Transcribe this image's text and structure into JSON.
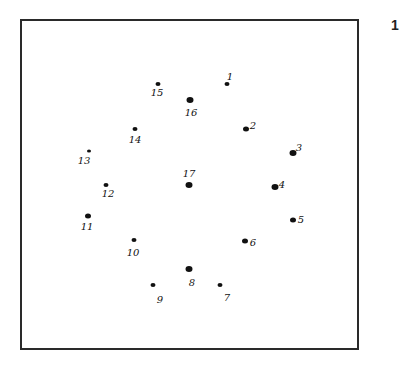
{
  "figure": {
    "number": "1",
    "frame": {
      "left": 20,
      "top": 19,
      "width": 339,
      "height": 331,
      "border_color": "#2a2a2a"
    },
    "ink_color": "#111111",
    "points": [
      {
        "label": "1",
        "x": 227,
        "y": 84,
        "r": 5,
        "lx": 230,
        "ly": 77
      },
      {
        "label": "2",
        "x": 246,
        "y": 129,
        "r": 6,
        "lx": 253,
        "ly": 126
      },
      {
        "label": "3",
        "x": 293,
        "y": 153,
        "r": 7,
        "lx": 299,
        "ly": 148
      },
      {
        "label": "4",
        "x": 275,
        "y": 187,
        "r": 7,
        "lx": 282,
        "ly": 185
      },
      {
        "label": "5",
        "x": 293,
        "y": 220,
        "r": 6,
        "lx": 301,
        "ly": 220
      },
      {
        "label": "6",
        "x": 245,
        "y": 241,
        "r": 6,
        "lx": 253,
        "ly": 243
      },
      {
        "label": "7",
        "x": 220,
        "y": 285,
        "r": 5,
        "lx": 227,
        "ly": 298
      },
      {
        "label": "8",
        "x": 189,
        "y": 269,
        "r": 7,
        "lx": 192,
        "ly": 283
      },
      {
        "label": "9",
        "x": 153,
        "y": 285,
        "r": 5,
        "lx": 160,
        "ly": 300
      },
      {
        "label": "10",
        "x": 134,
        "y": 240,
        "r": 5,
        "lx": 133,
        "ly": 253
      },
      {
        "label": "11",
        "x": 88,
        "y": 216,
        "r": 6,
        "lx": 87,
        "ly": 227
      },
      {
        "label": "12",
        "x": 106,
        "y": 185,
        "r": 5,
        "lx": 108,
        "ly": 194
      },
      {
        "label": "13",
        "x": 89,
        "y": 151,
        "r": 4,
        "lx": 84,
        "ly": 161
      },
      {
        "label": "14",
        "x": 135,
        "y": 129,
        "r": 5,
        "lx": 135,
        "ly": 140
      },
      {
        "label": "15",
        "x": 158,
        "y": 84,
        "r": 5,
        "lx": 157,
        "ly": 93
      },
      {
        "label": "16",
        "x": 190,
        "y": 100,
        "r": 7,
        "lx": 191,
        "ly": 113
      },
      {
        "label": "17",
        "x": 189,
        "y": 185,
        "r": 7,
        "lx": 189,
        "ly": 174
      }
    ]
  }
}
